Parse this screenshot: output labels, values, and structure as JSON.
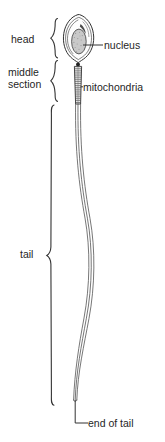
{
  "figure": {
    "line_color": "#333333",
    "fill_light": "#f0f0f0",
    "fill_nucleus": "#c9c9c9",
    "text_color": "#1f1f1f",
    "background": "#ffffff"
  },
  "bracket_labels": [
    {
      "id": "head",
      "label": "head"
    },
    {
      "id": "middle",
      "label_line1": "middle",
      "label_line2": "section"
    },
    {
      "id": "tail",
      "label": "tail"
    }
  ],
  "leader_labels": [
    {
      "id": "nucleus",
      "label": "nucleus"
    },
    {
      "id": "mitochondria",
      "label": "mitochondria"
    },
    {
      "id": "end-of-tail",
      "label": "end of tail"
    }
  ],
  "parts": {
    "head": "head",
    "middle_1": "middle",
    "middle_2": "section",
    "tail": "tail",
    "nucleus": "nucleus",
    "mitochondria": "mitochondria",
    "end_of_tail": "end of tail"
  }
}
